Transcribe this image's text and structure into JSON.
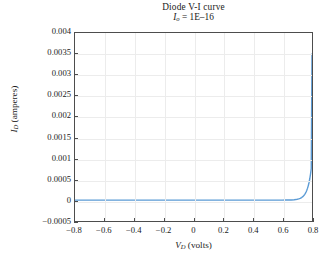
{
  "chart_data": {
    "type": "line",
    "title": "Diode V-I curve",
    "subtitle_symbol": "I",
    "subtitle_subscript": "o",
    "subtitle_value": "= 1E–16",
    "subtitle_plain": "I_o = 1E-16",
    "xlabel_symbol": "V",
    "xlabel_subscript": "D",
    "xlabel_units": "(volts)",
    "xlabel": "V_D (volts)",
    "ylabel_symbol": "I",
    "ylabel_subscript": "D",
    "ylabel_units": "(amperes)",
    "ylabel": "I_D (amperes)",
    "xlim": [
      -0.8,
      0.8
    ],
    "ylim": [
      -0.0005,
      0.004
    ],
    "grid": true,
    "legend": null,
    "line_color": "#5b9bd5",
    "axis_color": "#4d4d4d",
    "grid_color": "#ececec",
    "xticks": [
      -0.8,
      -0.6,
      -0.4,
      -0.2,
      0,
      0.2,
      0.4,
      0.6,
      0.8
    ],
    "xtick_labels": [
      "−0.8",
      "−0.6",
      "−0.4",
      "−0.2",
      "0",
      "0.2",
      "0.4",
      "0.6",
      "0.8"
    ],
    "yticks": [
      -0.0005,
      0,
      0.0005,
      0.001,
      0.0015,
      0.002,
      0.0025,
      0.003,
      0.0035,
      0.004
    ],
    "ytick_labels": [
      "−0.0005",
      "0",
      "0.0005",
      "0.001",
      "0.0015",
      "0.002",
      "0.0025",
      "0.003",
      "0.0035",
      "0.004"
    ],
    "x": [
      -0.8,
      -0.7,
      -0.6,
      -0.5,
      -0.4,
      -0.3,
      -0.2,
      -0.1,
      0.0,
      0.1,
      0.2,
      0.3,
      0.4,
      0.45,
      0.5,
      0.55,
      0.58,
      0.6,
      0.62,
      0.64,
      0.66,
      0.68,
      0.69,
      0.7,
      0.71,
      0.72,
      0.73,
      0.74,
      0.745,
      0.75,
      0.755,
      0.76,
      0.765,
      0.77,
      0.775,
      0.78,
      0.785,
      0.79,
      0.795,
      0.8
    ],
    "y": [
      0.0,
      0.0,
      0.0,
      0.0,
      0.0,
      0.0,
      0.0,
      0.0,
      0.0,
      0.0,
      0.0,
      0.0,
      0.0,
      0.0,
      0.0,
      1e-07,
      2e-07,
      4e-07,
      9e-07,
      1.9e-06,
      4.1e-06,
      8.9e-06,
      1.31e-05,
      1.93e-05,
      2.83e-05,
      4.17e-05,
      6.13e-05,
      9.02e-05,
      0.0001094,
      0.0001327,
      0.0001609,
      0.0001951,
      0.0002366,
      0.0002869,
      0.0003479,
      0.0004219,
      0.0005116,
      0.0006203,
      0.0007522,
      0.0035
    ],
    "series_description": "Shockley diode equation I_D = I_o (exp(V_D/V_T) - 1) with I_o = 1E-16, rising steeply above roughly 0.7 V and reaching about 0.0035 A at 0.8 V"
  }
}
